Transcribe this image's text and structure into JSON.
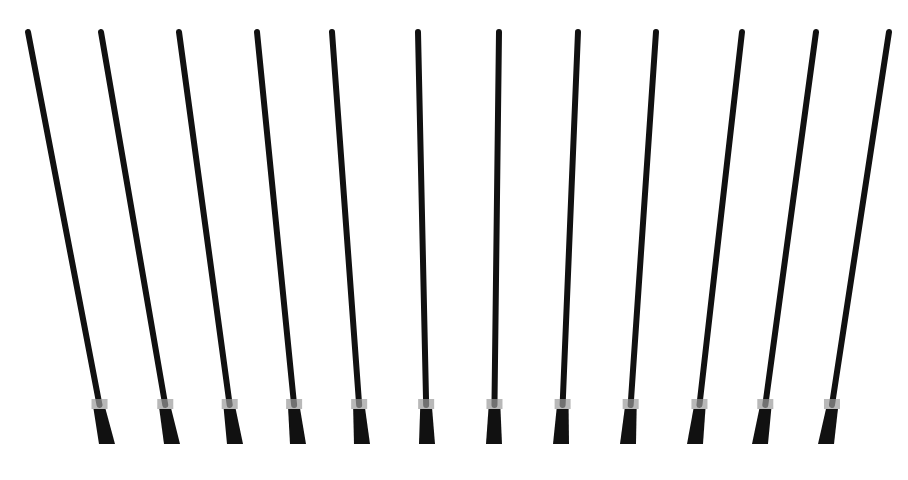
{
  "image": {
    "description": "Row of twelve thin black rods fanning outward, mounted in black sockets with small clips near the bottom, on a white background",
    "background": "#ffffff",
    "rod_color": "#111111",
    "clip_color": "#9a9a9a",
    "rods": [
      {
        "top_x": 28,
        "bottom_x": 107
      },
      {
        "top_x": 101,
        "bottom_x": 172
      },
      {
        "top_x": 179,
        "bottom_x": 235
      },
      {
        "top_x": 257,
        "bottom_x": 298
      },
      {
        "top_x": 332,
        "bottom_x": 362
      },
      {
        "top_x": 418,
        "bottom_x": 427
      },
      {
        "top_x": 499,
        "bottom_x": 494
      },
      {
        "top_x": 578,
        "bottom_x": 561
      },
      {
        "top_x": 656,
        "bottom_x": 628
      },
      {
        "top_x": 742,
        "bottom_x": 695
      },
      {
        "top_x": 816,
        "bottom_x": 760
      },
      {
        "top_x": 889,
        "bottom_x": 826
      }
    ]
  }
}
